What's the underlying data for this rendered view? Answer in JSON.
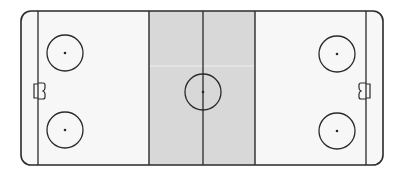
{
  "diagram": {
    "colors": {
      "background": "#ffffff",
      "ice": "#f7f7f7",
      "neutral_zone": "#d8d8d8",
      "lines": "#2a2a2a"
    },
    "rink": {
      "x": 21,
      "y": 11,
      "width": 362,
      "height": 154,
      "corner_radius": 10
    },
    "goal_lines": [
      38,
      366
    ],
    "blue_lines": [
      149,
      255
    ],
    "center_line": 203,
    "center_circle": {
      "cx": 203,
      "cy": 92,
      "r": 18
    },
    "faceoff_circles": [
      {
        "name": "left-top",
        "cx": 65,
        "cy": 53,
        "r": 18
      },
      {
        "name": "left-bottom",
        "cx": 65,
        "cy": 130,
        "r": 18
      },
      {
        "name": "right-top",
        "cx": 337,
        "cy": 54,
        "r": 18
      },
      {
        "name": "right-bottom",
        "cx": 337,
        "cy": 131,
        "r": 18
      }
    ],
    "goals": [
      "left",
      "right"
    ]
  }
}
